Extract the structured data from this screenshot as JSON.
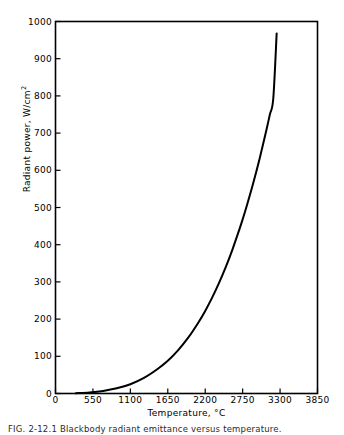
{
  "figure": {
    "caption": "FIG. 2-12.1  Blackbody radiant emittance versus temperature."
  },
  "chart_data": {
    "type": "line",
    "title": "",
    "xlabel": "Temperature, °C",
    "ylabel": "Radiant power, W/cm",
    "ylabel_exponent": "2",
    "xlim": [
      0,
      3850
    ],
    "ylim": [
      0,
      1000
    ],
    "xticks": [
      0,
      550,
      1100,
      1650,
      2200,
      2750,
      3300,
      3850
    ],
    "yticks": [
      0,
      100,
      200,
      300,
      400,
      500,
      600,
      700,
      800,
      900,
      1000
    ],
    "xtick_labels": [
      "0",
      "550",
      "1100",
      "1650",
      "2200",
      "2750",
      "3300",
      "3850"
    ],
    "ytick_labels": [
      "0",
      "100",
      "200",
      "300",
      "400",
      "500",
      "600",
      "700",
      "800",
      "900",
      "1000"
    ],
    "grid": false,
    "legend": null,
    "frame": "box",
    "tick_direction": "in",
    "line_color": "#000000",
    "line_width": 2.0,
    "series": [
      {
        "name": "Blackbody radiant power",
        "x": [
          300,
          500,
          700,
          900,
          1100,
          1300,
          1500,
          1650,
          1800,
          1950,
          2100,
          2200,
          2300,
          2400,
          2500,
          2600,
          2700,
          2750,
          2800,
          2900,
          3000,
          3100,
          3150,
          3200,
          3250
        ],
        "y": [
          1,
          3,
          7,
          14,
          25,
          42,
          66,
          88,
          116,
          150,
          191,
          222,
          257,
          296,
          339,
          387,
          440,
          468,
          498,
          562,
          632,
          709,
          750,
          793,
          968
        ]
      }
    ]
  }
}
